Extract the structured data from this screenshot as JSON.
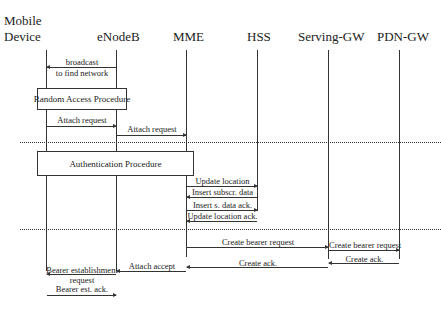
{
  "participants": [
    {
      "id": "mobile",
      "line1": "Mobile",
      "line2": "Device",
      "x": 47
    },
    {
      "id": "enodeb",
      "label": "eNodeB",
      "x": 117
    },
    {
      "id": "mme",
      "label": "MME",
      "x": 187
    },
    {
      "id": "hss",
      "label": "HSS",
      "x": 258
    },
    {
      "id": "sgw",
      "label": "Serving-GW",
      "x": 329
    },
    {
      "id": "pgw",
      "label": "PDN-GW",
      "x": 400
    }
  ],
  "procedures": {
    "random_access": "Random Access Procedure",
    "authentication": "Authentication Procedure"
  },
  "messages": [
    {
      "label": "broadcast",
      "label2": "to find network",
      "from": "eNodeB",
      "to": "Mobile Device"
    },
    {
      "label": "Attach request",
      "from": "Mobile Device",
      "to": "eNodeB"
    },
    {
      "label": "Attach request",
      "from": "eNodeB",
      "to": "MME"
    },
    {
      "label": "Update location",
      "from": "MME",
      "to": "HSS"
    },
    {
      "label": "Insert subscr. data",
      "from": "HSS",
      "to": "MME"
    },
    {
      "label": "Insert s. data ack.",
      "from": "MME",
      "to": "HSS"
    },
    {
      "label": "Update location ack.",
      "from": "HSS",
      "to": "MME"
    },
    {
      "label": "Create bearer request",
      "from": "MME",
      "to": "Serving-GW"
    },
    {
      "label": "Create bearer request",
      "from": "Serving-GW",
      "to": "PDN-GW"
    },
    {
      "label": "Create ack.",
      "from": "PDN-GW",
      "to": "Serving-GW"
    },
    {
      "label": "Create ack.",
      "from": "Serving-GW",
      "to": "MME"
    },
    {
      "label": "Attach accept",
      "from": "MME",
      "to": "eNodeB"
    },
    {
      "label": "Bearer establishment",
      "label2": "request",
      "from": "eNodeB",
      "to": "Mobile Device"
    },
    {
      "label": "Bearer est. ack.",
      "from": "Mobile Device",
      "to": "eNodeB"
    }
  ]
}
